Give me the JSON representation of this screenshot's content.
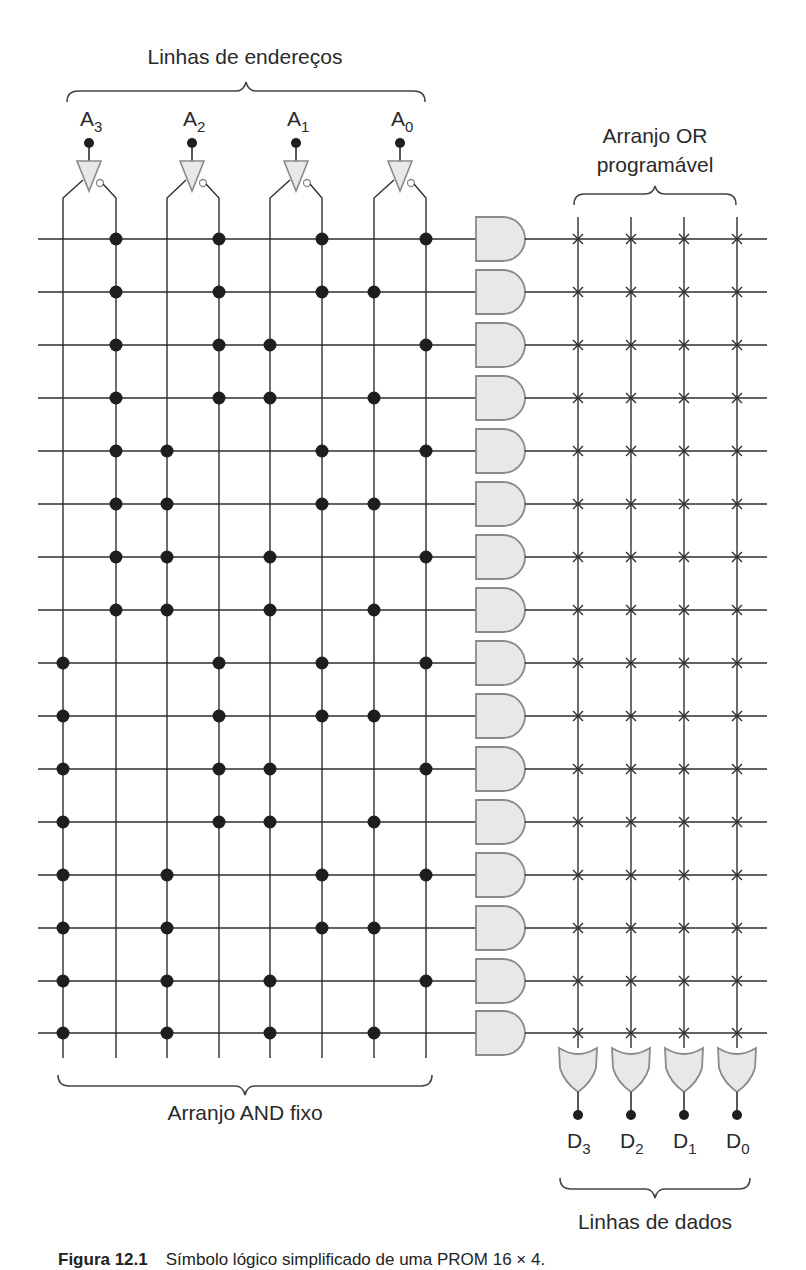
{
  "figure": {
    "caption_prefix": "Figura 12.1",
    "caption_text": "Símbolo lógico simplificado de uma PROM 16 × 4."
  },
  "labels": {
    "address_lines": "Linhas de endereços",
    "or_array_line1": "Arranjo OR",
    "or_array_line2": "programável",
    "and_array": "Arranjo AND fixo",
    "data_lines": "Linhas de dados"
  },
  "inputs": [
    {
      "name": "A",
      "sub": "3",
      "x": 89
    },
    {
      "name": "A",
      "sub": "2",
      "x": 192
    },
    {
      "name": "A",
      "sub": "1",
      "x": 296
    },
    {
      "name": "A",
      "sub": "0",
      "x": 400
    }
  ],
  "outputs": [
    {
      "name": "D",
      "sub": "3",
      "x": 578
    },
    {
      "name": "D",
      "sub": "2",
      "x": 631
    },
    {
      "name": "D",
      "sub": "1",
      "x": 684
    },
    {
      "name": "D",
      "sub": "0",
      "x": 737
    }
  ],
  "and_array": {
    "columns": [
      "A3",
      "A3'",
      "A2",
      "A2'",
      "A1",
      "A1'",
      "A0",
      "A0'"
    ],
    "column_x": [
      63,
      116,
      167,
      219,
      270,
      322,
      374,
      426
    ],
    "row_y": [
      239,
      292,
      345,
      398,
      451,
      504,
      557,
      610,
      663,
      716,
      769,
      822,
      875,
      928,
      981,
      1033
    ],
    "rows": [
      "0000",
      "0001",
      "0010",
      "0011",
      "0100",
      "0101",
      "0110",
      "0111",
      "1000",
      "1001",
      "1010",
      "1011",
      "1100",
      "1101",
      "1110",
      "1111"
    ]
  },
  "or_array": {
    "column_x": [
      578,
      631,
      684,
      737
    ],
    "fuse_symbol": "x-fuse",
    "all_fuses_intact": true
  },
  "colors": {
    "wire": "#2e2e2e",
    "gate_fill": "#e8e8e8",
    "gate_stroke": "#8a8a8a",
    "dot": "#1e1e1e",
    "text": "#2a2a2a"
  }
}
